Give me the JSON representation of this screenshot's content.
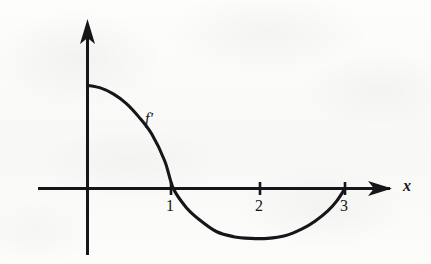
{
  "figure": {
    "kind": "hand-drawn calculus graph (scanned textbook figure)",
    "background_color": "#fbfbfa",
    "ink_color": "#16161a"
  },
  "chart_data": {
    "type": "line",
    "title": "",
    "subtitle": "",
    "xlabel": "x",
    "ylabel": "",
    "curve_label": "f'",
    "grid": false,
    "legend": "none",
    "axes": {
      "x_axis_visible": true,
      "y_axis_visible": true,
      "x_arrow": true,
      "y_arrow": true,
      "xlim": [
        -0.6,
        3.65
      ],
      "ylim": [
        -1.25,
        2.4
      ],
      "x_ticks": [
        1,
        2,
        3
      ],
      "x_tick_labels": [
        "1",
        "2",
        "3"
      ],
      "y_ticks": [],
      "y_tick_labels": []
    },
    "annotations": [
      {
        "text": "f'",
        "x": 0.95,
        "y": 0.95,
        "style": "italic"
      },
      {
        "text": "x",
        "x": 3.78,
        "y": 0.12,
        "style": "italic"
      }
    ],
    "series": [
      {
        "name": "f'",
        "description": "Derivative curve: starts positive at about y=1.2 when x=0, decreases through a zero at x=1, reaches a minimum of about y=-0.58 near x=2.1, then rises back to zero at x=3.",
        "x": [
          0.0,
          0.15,
          0.3,
          0.45,
          0.6,
          0.75,
          0.9,
          1.0,
          1.15,
          1.3,
          1.5,
          1.7,
          1.9,
          2.1,
          2.3,
          2.5,
          2.65,
          2.8,
          2.9,
          3.0
        ],
        "y": [
          1.2,
          1.17,
          1.1,
          0.99,
          0.83,
          0.63,
          0.32,
          0.0,
          -0.22,
          -0.36,
          -0.5,
          -0.56,
          -0.58,
          -0.58,
          -0.55,
          -0.47,
          -0.38,
          -0.26,
          -0.15,
          0.0
        ],
        "zeros": [
          1,
          3
        ],
        "minimum": {
          "x": 2.1,
          "y": -0.58
        },
        "y_intercept": 1.2
      }
    ]
  }
}
